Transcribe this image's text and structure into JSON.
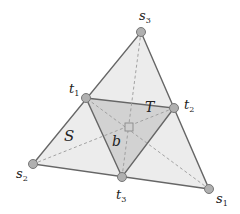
{
  "diagram": {
    "colors": {
      "outer_fill": "#ececec",
      "inner_fill": "#d2d2d2",
      "edge": "#666666",
      "dashed": "#9a9a9a",
      "vertex_fill": "#b0b0b0",
      "vertex_stroke": "#777777",
      "center_fill": "#cfcfcf",
      "center_stroke": "#888888"
    },
    "vertices": {
      "s1": {
        "x": 209,
        "y": 189,
        "label": "s",
        "sub": "1"
      },
      "s2": {
        "x": 33,
        "y": 164,
        "label": "s",
        "sub": "2"
      },
      "s3": {
        "x": 141,
        "y": 32,
        "label": "s",
        "sub": "3"
      },
      "t1": {
        "x": 86,
        "y": 98,
        "label": "t",
        "sub": "1"
      },
      "t2": {
        "x": 174,
        "y": 108,
        "label": "t",
        "sub": "2"
      },
      "t3": {
        "x": 122,
        "y": 177,
        "label": "t",
        "sub": "3"
      }
    },
    "center": {
      "x": 129,
      "y": 127,
      "label": "b"
    },
    "region_labels": {
      "S": "S",
      "T": "T"
    }
  }
}
